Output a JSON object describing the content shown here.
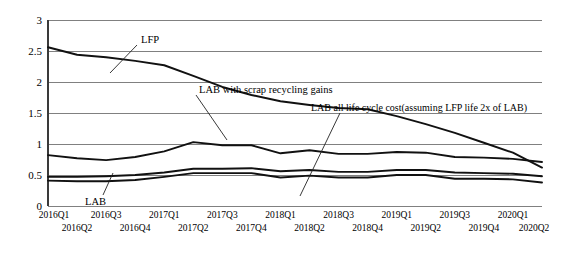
{
  "chart_data": {
    "type": "line",
    "title": "",
    "subtitle": "",
    "xlabel": "",
    "ylabel": "",
    "ylim": [
      0,
      3
    ],
    "yticks": [
      "0",
      "0.5",
      "1",
      "1.5",
      "2",
      "2.5",
      "3"
    ],
    "ytick_values": [
      0,
      0.5,
      1,
      1.5,
      2,
      2.5,
      3
    ],
    "grid": true,
    "legend_position": "none",
    "categories": [
      "2016Q1",
      "2016Q2",
      "2016Q3",
      "2016Q4",
      "2017Q1",
      "2017Q2",
      "2017Q3",
      "2017Q4",
      "2018Q1",
      "2018Q2",
      "2018Q3",
      "2018Q4",
      "2019Q1",
      "2019Q2",
      "2019Q3",
      "2019Q4",
      "2020Q1",
      "2020Q2"
    ],
    "series": [
      {
        "name": "LFP",
        "values": [
          2.56,
          2.44,
          2.4,
          2.34,
          2.27,
          2.1,
          1.92,
          1.79,
          1.69,
          1.63,
          1.58,
          1.56,
          1.45,
          1.32,
          1.18,
          1.02,
          0.86,
          0.62
        ]
      },
      {
        "name": "LAB all life cycle cost(assuming LFP life 2x of LAB)",
        "values": [
          0.82,
          0.77,
          0.74,
          0.79,
          0.88,
          1.03,
          0.98,
          0.98,
          0.85,
          0.9,
          0.84,
          0.84,
          0.87,
          0.86,
          0.79,
          0.78,
          0.76,
          0.71
        ]
      },
      {
        "name": "LAB with scrap recycling gains",
        "values": [
          0.47,
          0.47,
          0.48,
          0.5,
          0.54,
          0.6,
          0.6,
          0.61,
          0.56,
          0.58,
          0.55,
          0.55,
          0.58,
          0.58,
          0.54,
          0.53,
          0.52,
          0.48
        ]
      },
      {
        "name": "LAB",
        "values": [
          0.41,
          0.4,
          0.4,
          0.42,
          0.47,
          0.53,
          0.53,
          0.53,
          0.46,
          0.49,
          0.46,
          0.46,
          0.5,
          0.5,
          0.44,
          0.44,
          0.43,
          0.38
        ]
      }
    ],
    "annotations": [
      {
        "id": "lfp",
        "text": "LFP",
        "points_to_series": "LFP"
      },
      {
        "id": "lab-scrap",
        "text": "LAB with scrap recycling gains",
        "points_to_series": "LAB with scrap recycling gains"
      },
      {
        "id": "lab-all-life",
        "text": "LAB all life cycle cost(assuming LFP life 2x of LAB)",
        "points_to_series": "LAB all life cycle cost(assuming LFP life 2x of LAB)"
      },
      {
        "id": "lab",
        "text": "LAB",
        "points_to_series": "LAB"
      }
    ]
  }
}
